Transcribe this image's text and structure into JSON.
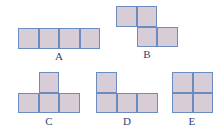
{
  "figure": {
    "cell_size_px": 20.5,
    "colors": {
      "cell_fill": "#d8ccd6",
      "cell_border": "#6a8cc0",
      "label_text": "#2f3f75",
      "background": "#ffffff"
    },
    "shapes": [
      {
        "id": "A",
        "label": "A",
        "kind": "I-tetromino",
        "origin": {
          "x": 18,
          "y": 28
        },
        "label_pos": {
          "x": 49,
          "y": 50,
          "width": 20
        },
        "cells": [
          {
            "col": 0,
            "row": 0
          },
          {
            "col": 1,
            "row": 0
          },
          {
            "col": 2,
            "row": 0
          },
          {
            "col": 3,
            "row": 0
          }
        ]
      },
      {
        "id": "B",
        "label": "B",
        "kind": "S-tetromino",
        "origin": {
          "x": 116,
          "y": 6
        },
        "label_pos": {
          "x": 137,
          "y": 48,
          "width": 20
        },
        "cells": [
          {
            "col": 0,
            "row": 0
          },
          {
            "col": 1,
            "row": 0
          },
          {
            "col": 1,
            "row": 1
          },
          {
            "col": 2,
            "row": 1
          }
        ]
      },
      {
        "id": "C",
        "label": "C",
        "kind": "T-tetromino",
        "origin": {
          "x": 18,
          "y": 72
        },
        "label_pos": {
          "x": 39,
          "y": 115,
          "width": 20
        },
        "cells": [
          {
            "col": 1,
            "row": 0
          },
          {
            "col": 0,
            "row": 1
          },
          {
            "col": 1,
            "row": 1
          },
          {
            "col": 2,
            "row": 1
          }
        ]
      },
      {
        "id": "D",
        "label": "D",
        "kind": "J-tetromino",
        "origin": {
          "x": 96,
          "y": 72
        },
        "label_pos": {
          "x": 117,
          "y": 115,
          "width": 20
        },
        "cells": [
          {
            "col": 0,
            "row": 0
          },
          {
            "col": 0,
            "row": 1
          },
          {
            "col": 1,
            "row": 1
          },
          {
            "col": 2,
            "row": 1
          }
        ]
      },
      {
        "id": "E",
        "label": "E",
        "kind": "O-tetromino",
        "origin": {
          "x": 172,
          "y": 72
        },
        "label_pos": {
          "x": 182,
          "y": 115,
          "width": 20
        },
        "cells": [
          {
            "col": 0,
            "row": 0
          },
          {
            "col": 1,
            "row": 0
          },
          {
            "col": 0,
            "row": 1
          },
          {
            "col": 1,
            "row": 1
          }
        ]
      }
    ]
  }
}
